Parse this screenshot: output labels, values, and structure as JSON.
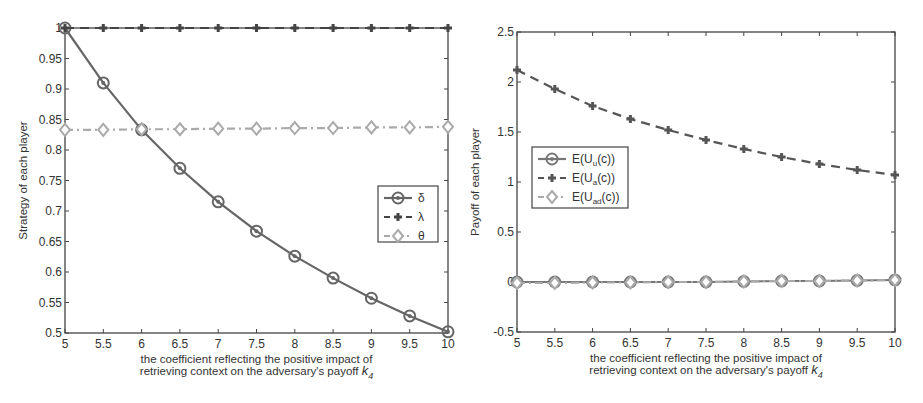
{
  "chart_data": [
    {
      "type": "line",
      "title": "",
      "xlabel_line1": "the coefficient reflecting the positive impact of",
      "xlabel_line2": "retrieving context on the adversary's payoff",
      "xlabel_symbol": "k",
      "xlabel_subscript": "4",
      "ylabel": "Strategy of each player",
      "x": [
        5,
        5.5,
        6,
        6.5,
        7,
        7.5,
        8,
        8.5,
        9,
        9.5,
        10
      ],
      "xlim": [
        5,
        10
      ],
      "ylim": [
        0.5,
        1
      ],
      "xticks": [
        "5",
        "5.5",
        "6",
        "6.5",
        "7",
        "7.5",
        "8",
        "8.5",
        "9",
        "9.5",
        "10"
      ],
      "yticks": [
        "0.5",
        "0.55",
        "0.6",
        "0.65",
        "0.7",
        "0.75",
        "0.8",
        "0.85",
        "0.9",
        "0.95",
        "1"
      ],
      "grid": false,
      "legend_position": "right-middle",
      "series": [
        {
          "name": "δ",
          "style": "solid",
          "marker": "circle",
          "color": "#666666",
          "values": [
            1.0,
            0.91,
            0.833,
            0.77,
            0.715,
            0.667,
            0.626,
            0.59,
            0.557,
            0.528,
            0.502
          ]
        },
        {
          "name": "λ",
          "style": "dashed",
          "marker": "plus",
          "color": "#444444",
          "values": [
            1.0,
            1.0,
            1.0,
            1.0,
            1.0,
            1.0,
            1.0,
            1.0,
            1.0,
            1.0,
            1.0
          ]
        },
        {
          "name": "θ",
          "style": "dashdot",
          "marker": "diamond",
          "color": "#aaaaaa",
          "values": [
            0.833,
            0.833,
            0.834,
            0.834,
            0.835,
            0.835,
            0.836,
            0.836,
            0.837,
            0.837,
            0.838
          ]
        }
      ]
    },
    {
      "type": "line",
      "title": "",
      "xlabel_line1": "the coefficient reflecting the positive impact of",
      "xlabel_line2": "retrieving context on the adversary's payoff",
      "xlabel_symbol": "k",
      "xlabel_subscript": "4",
      "ylabel": "Payoff of each player",
      "x": [
        5,
        5.5,
        6,
        6.5,
        7,
        7.5,
        8,
        8.5,
        9,
        9.5,
        10
      ],
      "xlim": [
        5,
        10
      ],
      "ylim": [
        -0.5,
        2.5
      ],
      "xticks": [
        "5",
        "5.5",
        "6",
        "6.5",
        "7",
        "7.5",
        "8",
        "8.5",
        "9",
        "9.5",
        "10"
      ],
      "yticks": [
        "-0.5",
        "0",
        "0.5",
        "1",
        "1.5",
        "2",
        "2.5"
      ],
      "grid": false,
      "legend_position": "left-middle",
      "series": [
        {
          "name": "E(U_u(c))",
          "base": "E(U",
          "sub": "u",
          "tail": "(c))",
          "style": "solid",
          "marker": "circle",
          "color": "#777777",
          "values": [
            0,
            0,
            0,
            0,
            0,
            0,
            0.005,
            0.01,
            0.01,
            0.015,
            0.02
          ]
        },
        {
          "name": "E(U_a(c))",
          "base": "E(U",
          "sub": "a",
          "tail": "(c))",
          "style": "dashed",
          "marker": "plus",
          "color": "#555555",
          "values": [
            2.12,
            1.93,
            1.76,
            1.63,
            1.52,
            1.42,
            1.33,
            1.25,
            1.18,
            1.12,
            1.07
          ]
        },
        {
          "name": "E(U_ad(c))",
          "base": "E(U",
          "sub": "ad",
          "tail": "(c))",
          "style": "dashdot",
          "marker": "diamond",
          "color": "#aaaaaa",
          "values": [
            -0.01,
            -0.01,
            -0.005,
            -0.005,
            0,
            0,
            0.005,
            0.01,
            0.01,
            0.015,
            0.02
          ]
        }
      ]
    }
  ]
}
